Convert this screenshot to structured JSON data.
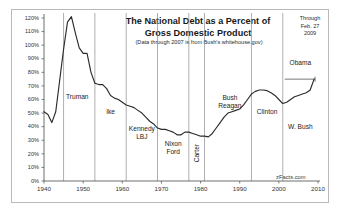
{
  "figure": {
    "watermark": "zFacts.com",
    "through_note": "Through\nFeb. 27\n2009",
    "through_line1": "Through",
    "through_line2": "Feb. 27",
    "through_line3": "2009"
  },
  "chart_data": {
    "type": "line",
    "title": "The National Debt as a Percent of Gross Domestic Product",
    "title_line1": "The National Debt as a Percent of",
    "title_line2": "Gross Domestic Product",
    "subtitle": "(Data through 2007 is from Bush's whitehouse.gov)",
    "xlabel": "",
    "ylabel": "",
    "xlim": [
      1940,
      2010
    ],
    "ylim": [
      0,
      120
    ],
    "grid": false,
    "legend_position": "none",
    "line_color": "#2b2b2b",
    "xticks": [
      1940,
      1950,
      1960,
      1970,
      1980,
      1990,
      2000,
      2010
    ],
    "xtick_labels": [
      "1940",
      "1950",
      "1960",
      "1970",
      "1980",
      "1990",
      "2000",
      "2010"
    ],
    "yticks": [
      0,
      10,
      20,
      30,
      40,
      50,
      60,
      70,
      80,
      90,
      100,
      110,
      120
    ],
    "ytick_labels": [
      "0%",
      "10%",
      "20%",
      "30%",
      "40%",
      "50%",
      "60%",
      "70%",
      "80%",
      "90%",
      "100%",
      "110%",
      "120%"
    ],
    "series": [
      {
        "name": "National Debt as % of GDP",
        "x": [
          1940,
          1941,
          1942,
          1943,
          1944,
          1945,
          1946,
          1947,
          1948,
          1949,
          1950,
          1951,
          1952,
          1953,
          1954,
          1955,
          1956,
          1957,
          1958,
          1959,
          1960,
          1961,
          1962,
          1963,
          1964,
          1965,
          1966,
          1967,
          1968,
          1969,
          1970,
          1971,
          1972,
          1973,
          1974,
          1975,
          1976,
          1977,
          1978,
          1979,
          1980,
          1981,
          1982,
          1983,
          1984,
          1985,
          1986,
          1987,
          1988,
          1989,
          1990,
          1991,
          1992,
          1993,
          1994,
          1995,
          1996,
          1997,
          1998,
          1999,
          2000,
          2001,
          2002,
          2003,
          2004,
          2005,
          2006,
          2007,
          2008,
          2009
        ],
        "values": [
          51.0,
          49.0,
          43.0,
          51.0,
          74.0,
          97.0,
          117.0,
          121.0,
          109.0,
          98.0,
          94.0,
          94.0,
          80.0,
          72.0,
          71.0,
          71.0,
          68.0,
          63.0,
          61.0,
          60.0,
          58.0,
          56.0,
          55.0,
          54.0,
          52.0,
          50.0,
          47.0,
          44.0,
          42.0,
          39.0,
          38.0,
          38.0,
          37.0,
          36.0,
          34.0,
          34.0,
          36.0,
          36.0,
          35.0,
          34.0,
          33.0,
          33.0,
          32.5,
          35.0,
          39.0,
          43.0,
          47.0,
          50.0,
          51.0,
          52.0,
          53.0,
          56.0,
          60.0,
          64.0,
          66.0,
          67.0,
          67.0,
          66.5,
          65.0,
          63.0,
          60.0,
          57.0,
          58.0,
          60.0,
          62.0,
          63.0,
          64.0,
          65.0,
          67.0,
          75.0
        ]
      }
    ],
    "obama_marker": {
      "label": "Obama",
      "start_year": 2001,
      "end_year": 2009,
      "level": 75
    },
    "annotations": [
      {
        "label": "Truman",
        "lines": [
          "Truman"
        ],
        "year": 1948.5,
        "value": 62,
        "rotation": 0
      },
      {
        "label": "Ike",
        "lines": [
          "Ike"
        ],
        "year": 1957.0,
        "value": 51,
        "rotation": 0
      },
      {
        "label": "Kennedy LBJ",
        "lines": [
          "Kennedy",
          "LBJ"
        ],
        "year": 1965.0,
        "value": 38,
        "rotation": 0
      },
      {
        "label": "Nixon Ford",
        "lines": [
          "Nixon",
          "Ford"
        ],
        "year": 1973.0,
        "value": 27,
        "rotation": 0
      },
      {
        "label": "Carter",
        "lines": [
          "Carter"
        ],
        "year": 1979.2,
        "value": 20,
        "rotation": 90
      },
      {
        "label": "Bush Reagan",
        "lines": [
          "Bush",
          "Reagan"
        ],
        "year": 1987.5,
        "value": 61,
        "rotation": 0
      },
      {
        "label": "Clinton",
        "lines": [
          "Clinton"
        ],
        "year": 1997.0,
        "value": 51,
        "rotation": 0
      },
      {
        "label": "W. Bush",
        "lines": [
          "W. Bush"
        ],
        "year": 2005.5,
        "value": 40,
        "rotation": 0
      },
      {
        "label": "Obama",
        "lines": [
          "Obama"
        ],
        "year": 2005.5,
        "value": 87,
        "rotation": 0
      }
    ],
    "dividers": [
      {
        "year": 1945,
        "name": "truman-start"
      },
      {
        "year": 1953,
        "name": "ike-start"
      },
      {
        "year": 1961,
        "name": "kennedy-start"
      },
      {
        "year": 1969,
        "name": "nixon-start"
      },
      {
        "year": 1977,
        "name": "carter-start"
      },
      {
        "year": 1981,
        "name": "reagan-start"
      },
      {
        "year": 1993,
        "name": "clinton-start"
      },
      {
        "year": 2001,
        "name": "w-bush-start"
      }
    ]
  },
  "annotation_text": {
    "truman": "Truman",
    "ike": "Ike",
    "kennedy": "Kennedy",
    "lbj": "LBJ",
    "nixon": "Nixon",
    "ford": "Ford",
    "carter": "Carter",
    "bush": "Bush",
    "reagan": "Reagan",
    "clinton": "Clinton",
    "w_bush": "W. Bush",
    "obama": "Obama"
  }
}
